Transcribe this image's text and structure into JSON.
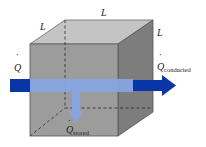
{
  "figure": {
    "colors": {
      "front_face": "#9a9a9a",
      "top_face": "#c4c4c4",
      "side_face": "#7a7a7a",
      "edge": "#555555",
      "hidden_edge": "#333333",
      "arrow_dark": "#0a35a8",
      "arrow_light": "#86a4e0"
    },
    "labels": {
      "side_left": "L",
      "side_top": "L",
      "side_right": "L",
      "q_in": "Q",
      "q_conducted_main": "Q",
      "q_conducted_sub": "conducted",
      "q_stored_main": "Q",
      "q_stored_sub": "stored",
      "dot": "·"
    }
  }
}
